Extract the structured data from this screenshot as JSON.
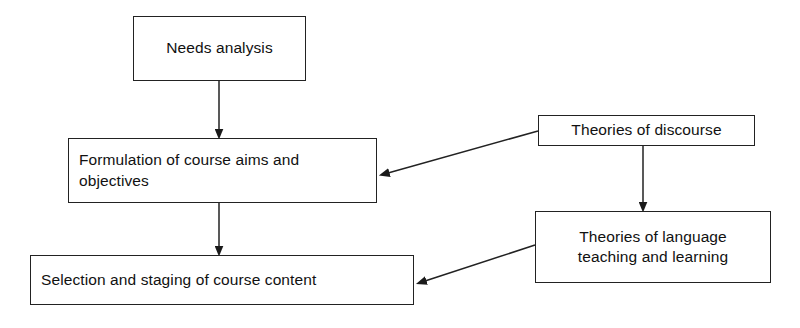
{
  "diagram": {
    "type": "flowchart",
    "background_color": "#ffffff",
    "line_color": "#222222",
    "text_color": "#111111",
    "nodes": [
      {
        "id": "needs-analysis",
        "label": "Needs analysis",
        "align": "center",
        "x": 133,
        "y": 16,
        "width": 173,
        "height": 65
      },
      {
        "id": "formulation",
        "label": "Formulation of course aims and\nobjectives",
        "align": "left",
        "x": 68,
        "y": 138,
        "width": 309,
        "height": 65
      },
      {
        "id": "selection",
        "label": "Selection and staging of course content",
        "align": "left",
        "x": 30,
        "y": 255,
        "width": 384,
        "height": 50
      },
      {
        "id": "theories-discourse",
        "label": "Theories of discourse",
        "align": "center",
        "x": 538,
        "y": 115,
        "width": 217,
        "height": 31
      },
      {
        "id": "theories-language",
        "label": "Theories of language\nteaching and learning",
        "align": "center",
        "x": 535,
        "y": 211,
        "width": 236,
        "height": 72
      }
    ],
    "edges": [
      {
        "id": "needs-to-formulation",
        "from": "needs-analysis",
        "to": "formulation",
        "style": "vertical-arrow",
        "points": "219,81 219,132"
      },
      {
        "id": "formulation-to-selection",
        "from": "formulation",
        "to": "selection",
        "style": "vertical-arrow",
        "points": "219,203 219,249"
      },
      {
        "id": "discourse-to-formulation",
        "from": "theories-discourse",
        "to": "formulation",
        "style": "diagonal-arrow",
        "points": "538,131 385,174"
      },
      {
        "id": "discourse-to-language",
        "from": "theories-discourse",
        "to": "theories-language",
        "style": "vertical-arrow",
        "points": "643,146 643,205"
      },
      {
        "id": "language-to-selection",
        "from": "theories-language",
        "to": "selection",
        "style": "diagonal-arrow",
        "points": "535,245 422,282"
      }
    ]
  }
}
